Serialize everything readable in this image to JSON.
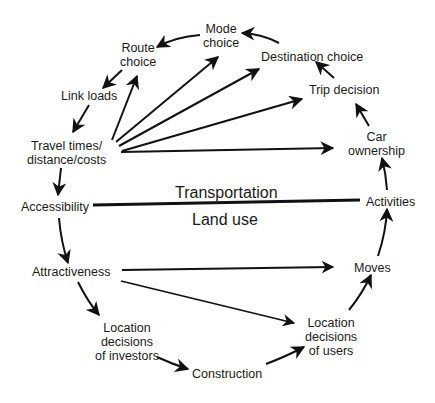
{
  "diagram": {
    "band_labels": {
      "upper": "Transportation",
      "lower": "Land use"
    },
    "nodes": {
      "route_choice": [
        "Route",
        "choice"
      ],
      "mode_choice": [
        "Mode",
        "choice"
      ],
      "destination_choice": [
        "Destination choice"
      ],
      "trip_decision": [
        "Trip decision"
      ],
      "car_ownership": [
        "Car",
        "ownership"
      ],
      "link_loads": [
        "Link loads"
      ],
      "travel_times": [
        "Travel times/",
        "distance/costs"
      ],
      "accessibility": [
        "Accessibility"
      ],
      "activities": [
        "Activities"
      ],
      "attractiveness": [
        "Attractiveness"
      ],
      "moves": [
        "Moves"
      ],
      "location_investors": [
        "Location",
        "decisions",
        "of investors"
      ],
      "location_users": [
        "Location",
        "decisions",
        "of users"
      ],
      "construction": [
        "Construction"
      ]
    },
    "edges": [
      {
        "from": "Destination choice",
        "to": "Mode choice"
      },
      {
        "from": "Mode choice",
        "to": "Route choice"
      },
      {
        "from": "Route choice",
        "to": "Link loads"
      },
      {
        "from": "Link loads",
        "to": "Travel times/distance/costs"
      },
      {
        "from": "Travel times/distance/costs",
        "to": "Accessibility"
      },
      {
        "from": "Travel times/distance/costs",
        "to": "Route choice"
      },
      {
        "from": "Travel times/distance/costs",
        "to": "Mode choice"
      },
      {
        "from": "Travel times/distance/costs",
        "to": "Destination choice"
      },
      {
        "from": "Travel times/distance/costs",
        "to": "Trip decision"
      },
      {
        "from": "Travel times/distance/costs",
        "to": "Car ownership"
      },
      {
        "from": "Trip decision",
        "to": "Destination choice"
      },
      {
        "from": "Car ownership",
        "to": "Trip decision"
      },
      {
        "from": "Activities",
        "to": "Car ownership"
      },
      {
        "from": "Moves",
        "to": "Activities"
      },
      {
        "from": "Accessibility",
        "to": "Attractiveness"
      },
      {
        "from": "Attractiveness",
        "to": "Moves"
      },
      {
        "from": "Attractiveness",
        "to": "Location decisions of users"
      },
      {
        "from": "Attractiveness",
        "to": "Location decisions of investors"
      },
      {
        "from": "Location decisions of investors",
        "to": "Construction"
      },
      {
        "from": "Construction",
        "to": "Location decisions of users"
      },
      {
        "from": "Location decisions of users",
        "to": "Moves"
      }
    ],
    "colors": {
      "line": "#111111",
      "text": "#1a1a1a",
      "background": "#ffffff"
    }
  }
}
